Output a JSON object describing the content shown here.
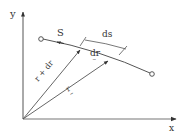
{
  "diagram": {
    "type": "vector-kinematics",
    "colors": {
      "stroke": "#555555",
      "text": "#333333",
      "background": "#ffffff"
    },
    "axes": {
      "x_label": "x",
      "y_label": "y"
    },
    "curve": {
      "label": "S",
      "start_marker": "open-circle",
      "end_marker": "open-circle"
    },
    "vectors": {
      "r": {
        "label": "r",
        "underline": "~"
      },
      "r_plus_dr": {
        "label": "r + dr"
      },
      "dr": {
        "label": "dr",
        "underline": "~"
      }
    },
    "dimension": {
      "label": "ds"
    }
  }
}
